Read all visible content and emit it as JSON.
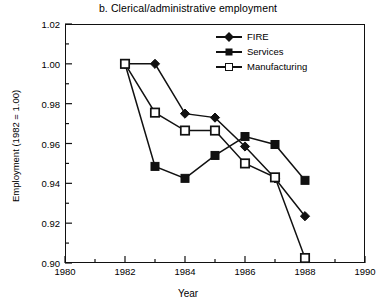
{
  "chart_data": {
    "type": "line",
    "title": "b.  Clerical/administrative employment",
    "xlabel": "Year",
    "ylabel": "Employment (1982 = 1.00)",
    "x": [
      1982,
      1983,
      1984,
      1985,
      1986,
      1987,
      1988
    ],
    "xlim": [
      1980,
      1990
    ],
    "ylim": [
      0.9,
      1.02
    ],
    "xticks": [
      1980,
      1982,
      1984,
      1986,
      1988,
      1990
    ],
    "xtick_labels": [
      "1980",
      "1982",
      "1984",
      "1986",
      "1988",
      "1990"
    ],
    "xminor_ticks": [
      1981,
      1983,
      1985,
      1987,
      1989
    ],
    "yticks": [
      0.9,
      0.92,
      0.94,
      0.96,
      0.98,
      1.0,
      1.02
    ],
    "ytick_labels": [
      "0.90",
      "0.92",
      "0.94",
      "0.96",
      "0.98",
      "1.00",
      "1.02"
    ],
    "yminor_ticks": [
      0.91,
      0.93,
      0.95,
      0.97,
      0.99,
      1.01
    ],
    "grid": false,
    "legend_position": "top-right-inside",
    "series": [
      {
        "name": "FIRE",
        "marker": "filled-diamond",
        "color": "#111111",
        "values": [
          1.0,
          1.0,
          0.975,
          0.973,
          0.9585,
          0.9425,
          0.9235
        ]
      },
      {
        "name": "Services",
        "marker": "filled-square",
        "color": "#111111",
        "values": [
          1.0,
          0.9485,
          0.9425,
          0.954,
          0.9635,
          0.9595,
          0.9415
        ]
      },
      {
        "name": "Manufacturing",
        "marker": "open-square",
        "color": "#111111",
        "values": [
          1.0,
          0.9755,
          0.9665,
          0.9665,
          0.95,
          0.943,
          0.9025
        ]
      }
    ]
  }
}
